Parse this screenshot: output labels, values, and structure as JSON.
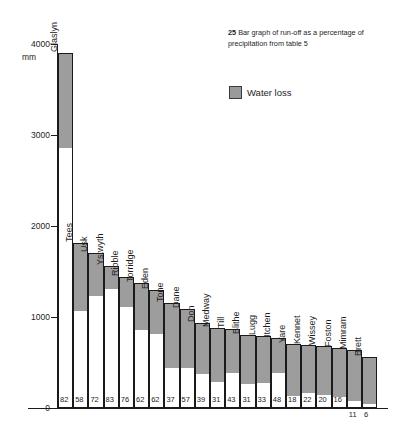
{
  "caption": {
    "number": "25",
    "text": "Bar graph of run-off as a percentage of precipitation from table 5"
  },
  "legend": {
    "items": [
      {
        "label": "Water loss",
        "color": "#9d9d9d"
      }
    ]
  },
  "axis": {
    "unit": "mm",
    "zero_label": "0",
    "ticks": [
      {
        "label": "4000",
        "value": 4000
      },
      {
        "label": "3000",
        "value": 3000
      },
      {
        "label": "2000",
        "value": 2000
      },
      {
        "label": "1000",
        "value": 1000
      }
    ]
  },
  "chart_data": {
    "type": "bar",
    "title": "Bar graph of run-off as a percentage of precipitation from table 5",
    "xlabel": "",
    "ylabel": "mm",
    "ylim": [
      0,
      4000
    ],
    "grid": false,
    "legend_position": "top-right",
    "annotation": "White lower portion of each bar = run-off; shaded upper portion = water loss. Number below each bar is run-off as a percentage of precipitation.",
    "categories": [
      "Glaslyn",
      "Tees",
      "Usk",
      "Ystwyth",
      "Ribble",
      "Torridge",
      "Eden",
      "Tone",
      "Dane",
      "Don",
      "Medway",
      "Till",
      "Blithe",
      "Lugg",
      "Itchen",
      "Yare",
      "Kennet",
      "Wissey",
      "Foston",
      "Mimram",
      "Brett"
    ],
    "series": [
      {
        "name": "Precipitation",
        "values": [
          3900,
          1810,
          1700,
          1560,
          1440,
          1370,
          1300,
          1150,
          1090,
          935,
          880,
          870,
          800,
          790,
          770,
          700,
          690,
          680,
          660,
          640,
          560
        ]
      },
      {
        "name": "Run-off",
        "values": [
          2850,
          1050,
          1224,
          1295,
          1094,
          849,
          806,
          426,
          425,
          365,
          273,
          374,
          248,
          261,
          370,
          126,
          152,
          136,
          106,
          70,
          34
        ]
      }
    ],
    "runoff_percent_labels": [
      "82",
      "58",
      "72",
      "83",
      "76",
      "62",
      "62",
      "37",
      "57",
      "39",
      "31",
      "43",
      "31",
      "33",
      "48",
      "18",
      "22",
      "20",
      "16",
      "11",
      "6"
    ],
    "bars": [
      {
        "name": "Glaslyn",
        "precipitation": 3900,
        "runoff_pct": "82"
      },
      {
        "name": "Tees",
        "precipitation": 1810,
        "runoff_pct": "58"
      },
      {
        "name": "Usk",
        "precipitation": 1700,
        "runoff_pct": "72"
      },
      {
        "name": "Ystwyth",
        "precipitation": 1560,
        "runoff_pct": "83"
      },
      {
        "name": "Ribble",
        "precipitation": 1440,
        "runoff_pct": "76"
      },
      {
        "name": "Torridge",
        "precipitation": 1370,
        "runoff_pct": "62"
      },
      {
        "name": "Eden",
        "precipitation": 1300,
        "runoff_pct": "62"
      },
      {
        "name": "Tone",
        "precipitation": 1150,
        "runoff_pct": "37"
      },
      {
        "name": "Dane",
        "precipitation": 1090,
        "runoff_pct": "57"
      },
      {
        "name": "Don",
        "precipitation": 935,
        "runoff_pct": "39"
      },
      {
        "name": "Medway",
        "precipitation": 880,
        "runoff_pct": "31"
      },
      {
        "name": "Till",
        "precipitation": 870,
        "runoff_pct": "43"
      },
      {
        "name": "Blithe",
        "precipitation": 800,
        "runoff_pct": "31"
      },
      {
        "name": "Lugg",
        "precipitation": 790,
        "runoff_pct": "33"
      },
      {
        "name": "Itchen",
        "precipitation": 770,
        "runoff_pct": "48"
      },
      {
        "name": "Yare",
        "precipitation": 700,
        "runoff_pct": "18"
      },
      {
        "name": "Kennet",
        "precipitation": 690,
        "runoff_pct": "22"
      },
      {
        "name": "Wissey",
        "precipitation": 680,
        "runoff_pct": "20"
      },
      {
        "name": "Foston",
        "precipitation": 660,
        "runoff_pct": "16"
      },
      {
        "name": "Mimram",
        "precipitation": 640,
        "runoff_pct": "11"
      },
      {
        "name": "Brett",
        "precipitation": 560,
        "runoff_pct": "6"
      }
    ]
  }
}
